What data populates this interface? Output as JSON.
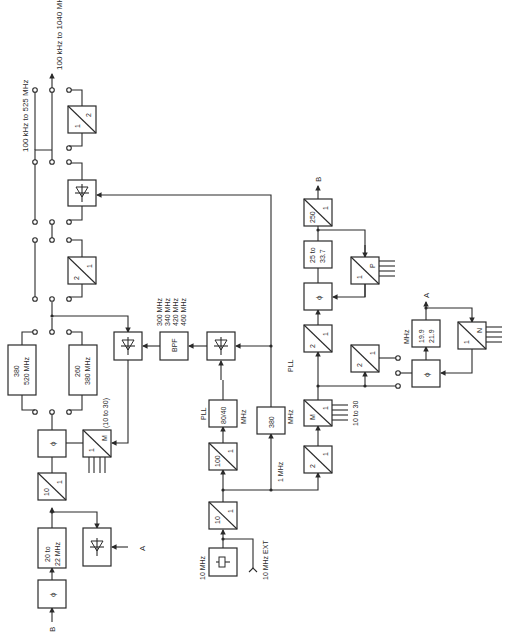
{
  "diagram": {
    "orientation": "rotated 90 degrees counter-clockwise",
    "outputs": {
      "out1": "100 kHz to 525 MHz",
      "out2": "100 kHz to 1040 MHz"
    },
    "inputs": {
      "ref_osc": "10 MHz",
      "ext_ref": "10 MHz EXT"
    },
    "connectors": {
      "A": "A",
      "B": "B"
    },
    "blocks": {
      "phase_b_in": "ϕ",
      "vco_20_22": [
        "20 to",
        "22 MHz"
      ],
      "mixer_a": "mixer",
      "div10_upper": {
        "num": "10",
        "den": "1"
      },
      "phase_main": "ϕ",
      "divm_upper": {
        "num": "1",
        "den": "M"
      },
      "divm_range": "(10 to 30)",
      "vco_380_520": [
        "380",
        "520 MHz"
      ],
      "vco_260_380": [
        "260",
        "380 MHz"
      ],
      "mixer_bpf": "mixer",
      "bpf": "BPF",
      "bpf_freqs": [
        "300 MHz",
        "340 MHz",
        "420 MHz",
        "460 MHz"
      ],
      "div2_mid": {
        "num": "2",
        "den": "1"
      },
      "mixer_top": "mixer",
      "div2_top": {
        "num": "1",
        "den": "2"
      },
      "ref_osc": "crystal",
      "div10_ref": {
        "num": "10",
        "den": "1"
      },
      "div100": {
        "num": "100",
        "den": "1"
      },
      "pll_8040": {
        "label": "PLL",
        "value": "80/40",
        "unit": "MHz"
      },
      "mixer_pll": "mixer",
      "pll_380": {
        "label": "PLL",
        "value": "380",
        "unit": "MHz"
      },
      "ref_1mhz": "1 MHz",
      "div2_low": {
        "num": "2",
        "den": "1"
      },
      "divm_low": {
        "num": "M",
        "den": "1"
      },
      "divm_low_range": "10 to 30",
      "div2_right": {
        "num": "2",
        "den": "1"
      },
      "phase_right": "ϕ",
      "vco_25_337": [
        "25 to",
        "33.7"
      ],
      "div250": {
        "num": "250",
        "den": "1"
      },
      "divp": {
        "num": "1",
        "den": "P"
      },
      "div2_small": {
        "num": "2",
        "den": "1"
      },
      "phase_a": "ϕ",
      "vco_199_219": [
        "19.9",
        "21.9"
      ],
      "vco_199_219_unit": "MHz",
      "divn": {
        "num": "1",
        "den": "N"
      }
    }
  }
}
